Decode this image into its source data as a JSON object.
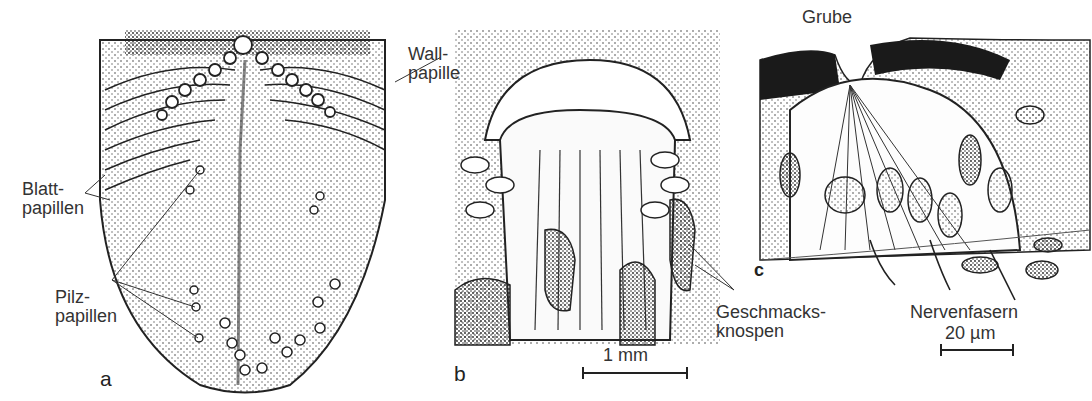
{
  "figure": {
    "panels": [
      {
        "id": "a",
        "label": "a",
        "subject": "tongue surface overview"
      },
      {
        "id": "b",
        "label": "b",
        "subject": "circumvallate papilla section"
      },
      {
        "id": "c",
        "label": "c",
        "subject": "taste bud section"
      }
    ],
    "annotations": {
      "blatt": [
        "Blatt-",
        "papillen"
      ],
      "pilz": [
        "Pilz-",
        "papillen"
      ],
      "wall": [
        "Wall-",
        "papille"
      ],
      "geschmack": [
        "Geschmacks-",
        "knospen"
      ],
      "grube": "Grube",
      "nerven": "Nervenfasern"
    },
    "scale_bars": {
      "b": "1 mm",
      "c": "20 µm"
    },
    "colors": {
      "ink": "#222222",
      "paper": "#ffffff",
      "stipple": "#555555",
      "dark_tissue": "#1a1a1a"
    }
  }
}
